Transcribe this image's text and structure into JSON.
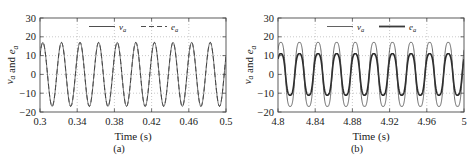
{
  "figure": {
    "width": 476,
    "height": 158,
    "background": "#ffffff",
    "line_color": "#3a3a3a",
    "grid_color": "#9a9a9a",
    "axis_color": "#4a4a4a"
  },
  "panels": [
    {
      "id": "a",
      "caption": "(a)",
      "chart_data": {
        "type": "line",
        "title": "",
        "xlabel": "Time (s)",
        "ylabel": "v_a and e_a",
        "ylabel_parts": [
          {
            "text": "v",
            "sub": "a"
          },
          {
            "text": " and "
          },
          {
            "text": "e",
            "sub": "a"
          }
        ],
        "xlim": [
          0.3,
          0.5
        ],
        "ylim": [
          -20,
          30
        ],
        "xticks": [
          0.3,
          0.34,
          0.38,
          0.42,
          0.46,
          0.5
        ],
        "xticklabels": [
          "0.3",
          "0.34",
          "0.38",
          "0.42",
          "0.46",
          "0.5"
        ],
        "yticks": [
          -20,
          -10,
          0,
          10,
          20,
          30
        ],
        "yticklabels": [
          "-20",
          "-10",
          "0",
          "10",
          "20",
          "30"
        ],
        "grid": "both-dotted",
        "legend_position": "top-center",
        "legend": [
          {
            "name": "v_a",
            "symbol": "v",
            "sub": "a",
            "style": "solid",
            "width": 0.9
          },
          {
            "name": "e_a",
            "symbol": "e",
            "sub": "a",
            "style": "dashed",
            "width": 0.9
          }
        ],
        "series": [
          {
            "name": "v_a",
            "style": "solid",
            "waveform": "sine",
            "amplitude": 17.0,
            "frequency_hz": 50,
            "phase_deg": 35,
            "offset": 0,
            "cycles_in_window": 10,
            "flat_top": 0.0
          },
          {
            "name": "e_a",
            "style": "dashed",
            "waveform": "sine",
            "amplitude": 17.0,
            "frequency_hz": 50,
            "phase_deg": 35,
            "offset": 0,
            "cycles_in_window": 10,
            "flat_top": 0.0,
            "note": "overlaps v_a"
          }
        ]
      }
    },
    {
      "id": "b",
      "caption": "(b)",
      "chart_data": {
        "type": "line",
        "title": "",
        "xlabel": "Time (s)",
        "ylabel": "v_a and e_a",
        "ylabel_parts": [
          {
            "text": "v",
            "sub": "a"
          },
          {
            "text": " and "
          },
          {
            "text": "e",
            "sub": "a"
          }
        ],
        "xlim": [
          4.8,
          5.0
        ],
        "ylim": [
          -20,
          30
        ],
        "xticks": [
          4.8,
          4.84,
          4.88,
          4.92,
          4.96,
          5.0
        ],
        "xticklabels": [
          "4.8",
          "4.84",
          "4.88",
          "4.92",
          "4.96",
          "5"
        ],
        "yticks": [
          -20,
          -10,
          0,
          10,
          20,
          30
        ],
        "yticklabels": [
          "-20",
          "-10",
          "0",
          "10",
          "20",
          "30"
        ],
        "grid": "both-dotted",
        "legend_position": "top-center",
        "legend": [
          {
            "name": "v_a",
            "symbol": "v",
            "sub": "a",
            "style": "solid",
            "width": 0.8
          },
          {
            "name": "e_a",
            "symbol": "e",
            "sub": "a",
            "style": "solid",
            "width": 1.8
          }
        ],
        "series": [
          {
            "name": "v_a",
            "style": "solid-thin",
            "waveform": "flat-top-sine",
            "amplitude": 17.0,
            "frequency_hz": 50,
            "phase_deg": 35,
            "offset": 0,
            "cycles_in_window": 10,
            "flat_top": 0.3
          },
          {
            "name": "e_a",
            "style": "solid-thick",
            "waveform": "flat-top-sine",
            "amplitude": 11.0,
            "frequency_hz": 50,
            "phase_deg": 35,
            "offset": 0,
            "cycles_in_window": 10,
            "flat_top": 0.22
          }
        ]
      }
    }
  ]
}
